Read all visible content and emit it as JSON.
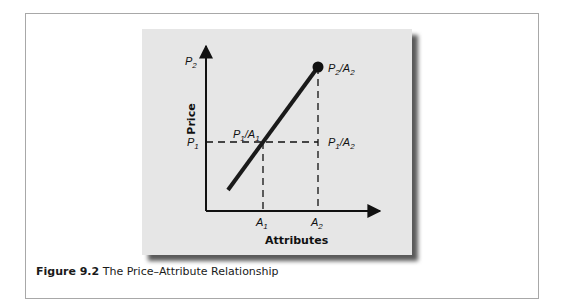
{
  "figure": {
    "caption_label": "Figure 9.2",
    "caption_title": "The Price–Attribute Relationship"
  },
  "diagram": {
    "y_axis_label": "Price",
    "x_axis_label": "Attributes",
    "y_ticks": {
      "p2": "P",
      "p2_sub": "2",
      "p1": "P",
      "p1_sub": "1"
    },
    "x_ticks": {
      "a1": "A",
      "a1_sub": "1",
      "a2": "A",
      "a2_sub": "2"
    },
    "points": {
      "p1a1": {
        "p": "P",
        "ps": "1",
        "a": "A",
        "as": "1"
      },
      "p1a2": {
        "p": "P",
        "ps": "1",
        "a": "A",
        "as": "2"
      },
      "p2a2": {
        "p": "P",
        "ps": "2",
        "a": "A",
        "as": "2"
      }
    },
    "colors": {
      "panel": "#e6e6e6",
      "line": "#1a1a1a",
      "frame": "#a8a8a8"
    }
  }
}
